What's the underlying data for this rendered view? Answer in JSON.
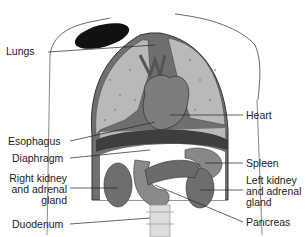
{
  "diagram": {
    "type": "anatomical illustration",
    "labels_left": [
      {
        "id": "lungs",
        "text": "Lungs"
      },
      {
        "id": "esophagus",
        "text": "Esophagus"
      },
      {
        "id": "diaphragm",
        "text": "Diaphragm"
      },
      {
        "id": "right_kidney",
        "lines": [
          "Right kidney",
          "and adrenal",
          "gland"
        ]
      },
      {
        "id": "duodenum",
        "text": "Duodenum"
      }
    ],
    "labels_right": [
      {
        "id": "heart",
        "text": "Heart"
      },
      {
        "id": "spleen",
        "text": "Spleen"
      },
      {
        "id": "left_kidney",
        "lines": [
          "Left kidney",
          "and adrenal",
          "gland"
        ]
      },
      {
        "id": "pancreas",
        "text": "Pancreas"
      }
    ],
    "colors": {
      "lung": "#b9b9b9",
      "heart": "#7d7d7d",
      "organ_dark": "#5e5e5e",
      "organ_mid": "#8a8a8a",
      "outline": "#333333"
    }
  }
}
